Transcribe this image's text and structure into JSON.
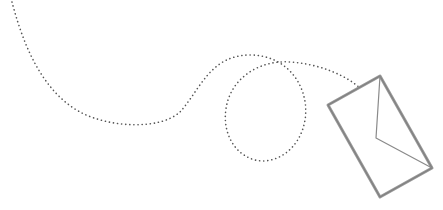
{
  "illustration": {
    "subject": "dotted flight path leading to a tilted envelope",
    "colors": {
      "background": "#ffffff",
      "path_dots": "#555555",
      "envelope_stroke": "#808080",
      "envelope_shadow": "#9a9a9a"
    },
    "icons": [
      "envelope-icon",
      "dotted-path"
    ]
  }
}
